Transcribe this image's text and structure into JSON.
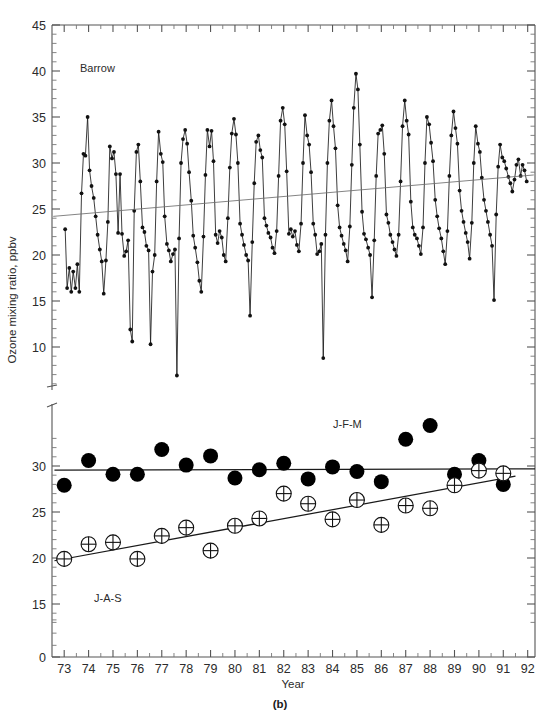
{
  "figure": {
    "caption": "(b)",
    "panel_annotation": "Barrow",
    "xlabel": "Year",
    "ylabel": "Ozone mixing ratio, ppbv"
  },
  "chart_data": {
    "type": "line",
    "title": "Barrow",
    "xlabel": "Year",
    "ylabel": "Ozone mixing ratio, ppbv",
    "grid": false,
    "legend_position": "in-plot annotations",
    "xlim": [
      72.5,
      92.3
    ],
    "xticks": [
      73,
      74,
      75,
      76,
      77,
      78,
      79,
      80,
      81,
      82,
      83,
      84,
      85,
      86,
      87,
      88,
      89,
      90,
      91,
      92
    ],
    "xticklabels": [
      "73",
      "74",
      "75",
      "76",
      "77",
      "78",
      "79",
      "80",
      "81",
      "82",
      "83",
      "84",
      "85",
      "86",
      "87",
      "88",
      "89",
      "90",
      "91",
      "92"
    ],
    "minor_xticks_per_interval": 1,
    "axis_break": {
      "present": true,
      "upper_panel_ylim": [
        5.0,
        45.0
      ],
      "lower_panel_ylim": [
        13.0,
        33.5
      ],
      "break_marker_y": 5.0
    },
    "upper_panel": {
      "yticks": [
        5,
        10,
        15,
        20,
        25,
        30,
        35,
        40,
        45
      ],
      "ytick_major_labels": [
        "5",
        "10",
        "15",
        "20",
        "25",
        "30",
        "35",
        "40",
        "45"
      ],
      "minor_yticks_per_interval": 4,
      "series": [
        {
          "name": "Barrow monthly ozone mixing ratio",
          "marker": "filled-circle-small",
          "line": true,
          "x": [
            73.04,
            73.12,
            73.21,
            73.29,
            73.37,
            73.46,
            73.54,
            73.62,
            73.71,
            73.79,
            73.87,
            73.96,
            74.04,
            74.12,
            74.21,
            74.29,
            74.37,
            74.46,
            74.54,
            74.62,
            74.71,
            74.79,
            74.87,
            74.96,
            75.04,
            75.12,
            75.21,
            75.29,
            75.37,
            75.46,
            75.54,
            75.62,
            75.71,
            75.79,
            75.87,
            75.96,
            76.04,
            76.12,
            76.21,
            76.29,
            76.37,
            76.46,
            76.54,
            76.62,
            76.71,
            76.79,
            76.87,
            76.96,
            77.04,
            77.12,
            77.21,
            77.29,
            77.37,
            77.46,
            77.54,
            77.62,
            77.71,
            77.79,
            77.87,
            77.96,
            78.04,
            78.12,
            78.21,
            78.29,
            78.37,
            78.46,
            78.54,
            78.62,
            78.71,
            78.79,
            78.87,
            78.96,
            79.04,
            79.12,
            79.21,
            79.29,
            79.37,
            79.46,
            79.54,
            79.62,
            79.71,
            79.79,
            79.87,
            79.96,
            80.04,
            80.12,
            80.21,
            80.29,
            80.37,
            80.46,
            80.54,
            80.62,
            80.71,
            80.79,
            80.87,
            80.96,
            81.04,
            81.12,
            81.21,
            81.29,
            81.37,
            81.46,
            81.54,
            81.62,
            81.71,
            81.79,
            81.87,
            81.96,
            82.04,
            82.12,
            82.21,
            82.29,
            82.37,
            82.46,
            82.54,
            82.62,
            82.71,
            82.79,
            82.87,
            82.96,
            83.04,
            83.12,
            83.21,
            83.29,
            83.37,
            83.46,
            83.54,
            83.62,
            83.71,
            83.79,
            83.87,
            83.96,
            84.04,
            84.12,
            84.21,
            84.29,
            84.37,
            84.46,
            84.54,
            84.62,
            84.71,
            84.79,
            84.87,
            84.96,
            85.04,
            85.12,
            85.21,
            85.29,
            85.37,
            85.46,
            85.54,
            85.62,
            85.71,
            85.79,
            85.87,
            85.96,
            86.04,
            86.12,
            86.21,
            86.29,
            86.37,
            86.46,
            86.54,
            86.62,
            86.71,
            86.79,
            86.87,
            86.96,
            87.04,
            87.12,
            87.21,
            87.29,
            87.37,
            87.46,
            87.54,
            87.62,
            87.71,
            87.79,
            87.87,
            87.96,
            88.04,
            88.12,
            88.21,
            88.29,
            88.37,
            88.46,
            88.54,
            88.62,
            88.71,
            88.79,
            88.87,
            88.96,
            89.04,
            89.12,
            89.21,
            89.29,
            89.37,
            89.46,
            89.54,
            89.62,
            89.71,
            89.79,
            89.87,
            89.96,
            90.04,
            90.12,
            90.21,
            90.29,
            90.37,
            90.46,
            90.54,
            90.62,
            90.71,
            90.79,
            90.87,
            90.96,
            91.04,
            91.12,
            91.21,
            91.29,
            91.37,
            91.46,
            91.54,
            91.62,
            91.71,
            91.79,
            91.87,
            91.96
          ],
          "y": [
            22.8,
            16.4,
            18.6,
            16.0,
            18.2,
            16.4,
            19.0,
            16.0,
            26.7,
            31.0,
            30.8,
            35.0,
            29.2,
            27.5,
            26.2,
            24.2,
            22.2,
            20.6,
            19.3,
            15.8,
            19.4,
            23.6,
            31.8,
            30.5,
            31.2,
            28.8,
            22.4,
            28.8,
            22.3,
            19.9,
            20.4,
            21.6,
            11.9,
            10.6,
            24.8,
            31.2,
            32.0,
            28.0,
            23.0,
            22.5,
            21.0,
            20.5,
            10.3,
            18.2,
            20.0,
            28.0,
            33.4,
            31.0,
            30.1,
            24.2,
            21.2,
            20.5,
            19.3,
            20.1,
            20.6,
            6.9,
            21.8,
            30.0,
            32.6,
            33.6,
            32.1,
            29.0,
            25.9,
            22.1,
            20.8,
            19.2,
            17.2,
            16.0,
            22.0,
            28.7,
            33.6,
            31.8,
            33.5,
            30.2,
            22.2,
            21.3,
            22.6,
            21.9,
            20.0,
            19.3,
            24.0,
            29.5,
            33.2,
            34.8,
            33.1,
            30.0,
            23.4,
            22.2,
            21.1,
            20.0,
            19.4,
            13.4,
            21.4,
            27.8,
            32.3,
            33.0,
            31.4,
            30.6,
            24.0,
            23.2,
            22.4,
            21.9,
            20.8,
            20.2,
            22.6,
            28.6,
            34.6,
            36.0,
            34.2,
            29.1,
            22.3,
            22.8,
            22.0,
            22.6,
            21.1,
            20.4,
            23.4,
            30.0,
            35.2,
            33.0,
            32.0,
            29.0,
            23.4,
            22.2,
            20.1,
            20.4,
            21.2,
            8.8,
            22.2,
            30.0,
            34.6,
            36.8,
            34.0,
            31.6,
            25.4,
            23.0,
            22.1,
            21.2,
            20.5,
            19.3,
            23.1,
            29.8,
            36.0,
            39.7,
            38.0,
            32.0,
            24.7,
            22.3,
            21.7,
            20.8,
            20.0,
            15.4,
            21.6,
            28.6,
            33.2,
            33.6,
            34.1,
            31.0,
            24.4,
            23.5,
            22.2,
            21.4,
            20.6,
            19.9,
            22.2,
            28.0,
            34.0,
            36.8,
            34.6,
            33.1,
            25.8,
            23.0,
            22.2,
            21.8,
            21.0,
            20.1,
            23.0,
            30.0,
            35.0,
            34.2,
            32.2,
            30.2,
            26.0,
            24.2,
            22.9,
            21.8,
            20.4,
            19.0,
            22.6,
            28.6,
            33.0,
            35.6,
            33.8,
            32.1,
            27.0,
            24.8,
            23.6,
            22.4,
            21.4,
            19.6,
            23.5,
            30.0,
            34.0,
            32.1,
            31.2,
            28.4,
            26.0,
            24.8,
            23.6,
            22.2,
            21.0,
            15.1,
            24.4,
            29.6,
            32.0,
            30.6,
            30.2,
            29.4,
            28.5,
            27.8,
            26.9,
            28.2,
            29.8,
            30.4,
            28.6,
            29.8,
            29.2,
            28.0
          ]
        }
      ],
      "trend_line": {
        "name": "Barrow annual-mean trend",
        "x": [
          72.55,
          92.25
        ],
        "y": [
          24.2,
          28.7
        ],
        "style": "thin-grey"
      }
    },
    "lower_panel": {
      "yticks": [
        0,
        15,
        20,
        25,
        30
      ],
      "ytick_major_labels": [
        "0",
        "15",
        "20",
        "25",
        "30"
      ],
      "minor_yticks_per_interval": 4,
      "zero_tick_value": 0,
      "series": [
        {
          "name": "J-F-M",
          "label": "J-F-M",
          "marker": "filled-circle",
          "marker_radius_px": 7.5,
          "x": [
            73,
            74,
            75,
            76,
            77,
            78,
            79,
            80,
            81,
            82,
            83,
            84,
            85,
            86,
            87,
            88,
            89,
            90,
            91
          ],
          "y": [
            27.9,
            30.6,
            29.1,
            29.1,
            31.8,
            30.1,
            31.1,
            28.7,
            29.6,
            30.3,
            28.6,
            29.9,
            29.4,
            28.3,
            32.9,
            34.4,
            29.1,
            30.6,
            28.0
          ]
        },
        {
          "name": "J-A-S",
          "label": "J-A-S",
          "marker": "open-circle-with-cross",
          "marker_radius_px": 7.5,
          "x": [
            73,
            74,
            75,
            76,
            77,
            78,
            79,
            80,
            81,
            82,
            83,
            84,
            85,
            86,
            87,
            88,
            89,
            90,
            91
          ],
          "y": [
            19.9,
            21.5,
            21.7,
            19.9,
            22.4,
            23.3,
            20.8,
            23.5,
            24.3,
            27.0,
            25.9,
            24.2,
            26.3,
            23.6,
            25.7,
            25.4,
            27.9,
            29.5,
            29.2
          ]
        }
      ],
      "trend_lines": [
        {
          "name": "J-F-M trend",
          "x": [
            72.6,
            92.3
          ],
          "y": [
            29.55,
            29.7
          ],
          "style": "thick-black"
        },
        {
          "name": "J-A-S trend",
          "x": [
            72.6,
            91.5
          ],
          "y": [
            19.7,
            28.9
          ],
          "style": "thick-black"
        }
      ]
    },
    "annotations": [
      {
        "text": "Barrow",
        "x_px": 80,
        "y_px": 72,
        "panel": "upper"
      },
      {
        "text": "J-F-M",
        "x_px": 333,
        "y_px": 428,
        "panel": "lower"
      },
      {
        "text": "J-A-S",
        "x_px": 94,
        "y_px": 602,
        "panel": "lower"
      }
    ]
  }
}
